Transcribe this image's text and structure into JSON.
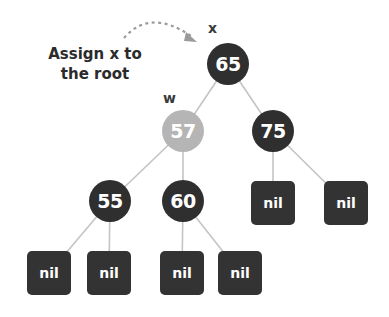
{
  "caption": {
    "line1": "Assign x to",
    "line2": "the root"
  },
  "labels": {
    "x": "x",
    "w": "w"
  },
  "colors": {
    "node_dark": "#2f2f2f",
    "node_highlight": "#b5b5b5",
    "edge": "#c4c4c4",
    "arrow": "#9a9a9a"
  },
  "nodes": {
    "root": "65",
    "left": "57",
    "right": "75",
    "left_left": "55",
    "left_right": "60"
  },
  "nil_nodes": [
    "nil",
    "nil",
    "nil",
    "nil",
    "nil",
    "nil"
  ]
}
